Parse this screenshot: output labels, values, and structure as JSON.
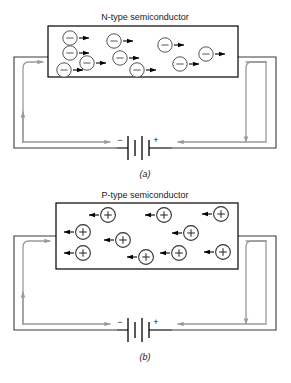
{
  "figure": {
    "background": "#ffffff",
    "wire_color": "#3b3b3b",
    "current_arrow_color": "#9a9a9a",
    "carrier_stroke": "#555555",
    "carrier_fill": "#ffffff",
    "carrier_arrow_color": "#000000"
  },
  "panels": [
    {
      "id": "panel-a",
      "title": "N-type semiconductor",
      "caption": "(a)",
      "carrier_type": "electron",
      "carrier_symbol": "−",
      "carrier_drift_direction": "right",
      "battery": {
        "negative_label": "−",
        "positive_label": "+",
        "negative_side": "left",
        "positive_side": "right"
      },
      "box": {
        "x": 48,
        "y": 26,
        "width": 190,
        "height": 51
      },
      "carriers": [
        {
          "cx": 70,
          "cy": 38
        },
        {
          "cx": 70,
          "cy": 53
        },
        {
          "cx": 85,
          "cy": 63
        },
        {
          "cx": 64,
          "cy": 77
        },
        {
          "cx": 116,
          "cy": 41
        },
        {
          "cx": 124,
          "cy": 62
        },
        {
          "cx": 138,
          "cy": 78
        },
        {
          "cx": 170,
          "cy": 44
        },
        {
          "cx": 208,
          "cy": 57
        },
        {
          "cx": 183,
          "cy": 72
        }
      ]
    },
    {
      "id": "panel-b",
      "title": "P-type semiconductor",
      "caption": "(b)",
      "carrier_type": "hole",
      "carrier_symbol": "+",
      "carrier_drift_direction": "left",
      "battery": {
        "negative_label": "−",
        "positive_label": "+",
        "negative_side": "left",
        "positive_side": "right"
      },
      "box": {
        "x": 56,
        "y": 203,
        "width": 182,
        "height": 66
      },
      "carriers": [
        {
          "cx": 108,
          "cy": 215
        },
        {
          "cx": 83,
          "cy": 232
        },
        {
          "cx": 83,
          "cy": 253
        },
        {
          "cx": 123,
          "cy": 240
        },
        {
          "cx": 144,
          "cy": 255
        },
        {
          "cx": 163,
          "cy": 215
        },
        {
          "cx": 192,
          "cy": 233
        },
        {
          "cx": 178,
          "cy": 253
        },
        {
          "cx": 220,
          "cy": 214
        },
        {
          "cx": 222,
          "cy": 252
        }
      ]
    }
  ]
}
